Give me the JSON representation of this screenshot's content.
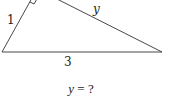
{
  "diagram": {
    "type": "right-triangle",
    "labels": {
      "short_leg": "1",
      "hypotenuse": "3",
      "unknown_leg": "y"
    },
    "right_angle_marker": true,
    "colors": {
      "stroke": "#333333",
      "text": "#222222"
    }
  },
  "question": {
    "variable": "y",
    "operator": "=",
    "answer": "?"
  }
}
